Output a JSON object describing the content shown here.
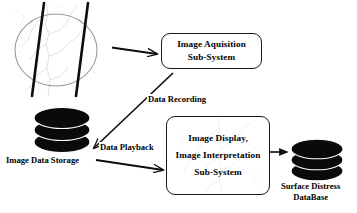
{
  "diagram": {
    "background_color": "#ffffff",
    "line_color": "#111111",
    "nodes": [
      {
        "id": "image-acquisition",
        "shape": "rounded-rectangle",
        "lines": [
          "Image Aquisition",
          "Sub-System"
        ]
      },
      {
        "id": "image-display-interpretation",
        "shape": "rounded-rectangle",
        "lines": [
          "Image Display,",
          "Image Interpretation",
          "Sub-System"
        ]
      }
    ],
    "datastores": [
      {
        "id": "image-data-storage",
        "label": "Image Data Storage",
        "shape": "cylinder-stack",
        "color": "#000000"
      },
      {
        "id": "surface-distress-database",
        "label_line1": "Surface Distress",
        "label_line2": "DataBase",
        "shape": "cylinder-stack",
        "color": "#000000"
      }
    ],
    "edges": [
      {
        "id": "road-to-acquisition",
        "label": "",
        "from": "road-photo",
        "to": "image-acquisition"
      },
      {
        "id": "acquisition-to-storage",
        "label": "Data Recording",
        "from": "image-acquisition",
        "to": "image-data-storage"
      },
      {
        "id": "storage-to-display",
        "label": "Data Playback",
        "from": "image-data-storage",
        "to": "image-display-interpretation"
      },
      {
        "id": "display-to-database",
        "label": "",
        "from": "image-display-interpretation",
        "to": "surface-distress-database"
      }
    ],
    "photos": [
      {
        "id": "road-photo",
        "description": "pavement-crack-photo-with-circle-highlight"
      },
      {
        "id": "inbox-photo",
        "description": "pavement-crack-photo-faint-background"
      }
    ]
  },
  "acq_box": {
    "line1": "Image Aquisition",
    "line2": "Sub-System"
  },
  "display_box": {
    "line1": "Image Display,",
    "line2": "Image Interpretation",
    "line3": "Sub-System"
  },
  "labels": {
    "data_recording": "Data Recording",
    "data_playback": "Data Playback",
    "image_data_storage": "Image Data Storage",
    "surface_distress_1": "Surface Distress",
    "surface_distress_2": "DataBase"
  }
}
